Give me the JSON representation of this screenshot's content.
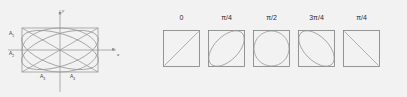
{
  "figure": {
    "background_color": "#f2f2f2",
    "stroke_color": "#8a8a8a",
    "text_color": "#3a3a3a"
  },
  "left_panel": {
    "name": "amplitude-rectangle-diagram",
    "axis_x_label": "x",
    "axis_y_label": "y",
    "labels": [
      {
        "text": "A",
        "sub": "1",
        "x": 9,
        "y": 33
      },
      {
        "text": "A",
        "sub": "2",
        "x": 9,
        "y": 53
      },
      {
        "text": "A",
        "sub": "3",
        "x": 40,
        "y": 75
      },
      {
        "text": "A",
        "sub": "4",
        "x": 70,
        "y": 75
      }
    ],
    "rect": {
      "x": 22,
      "y": 28,
      "width": 76,
      "height": 44
    },
    "origin": {
      "x": 60,
      "y": 50
    },
    "ellipses": [
      {
        "rx": 38,
        "ry": 22,
        "rotate": 0
      },
      {
        "rx": 40,
        "ry": 16,
        "rotate": 18
      },
      {
        "rx": 40,
        "ry": 16,
        "rotate": -18
      }
    ],
    "diagonals": true
  },
  "right_panel": {
    "name": "polarization-state-row",
    "box_size": 37,
    "box_top": 30,
    "label_top": 14,
    "boxes": [
      {
        "phase_label": "0",
        "shape": "line-diagonal-up",
        "left": 163
      },
      {
        "phase_label": "π/4",
        "shape": "ellipse-tilt-right",
        "left": 208
      },
      {
        "phase_label": "π/2",
        "shape": "circle",
        "left": 253
      },
      {
        "phase_label": "3π/4",
        "shape": "ellipse-tilt-left",
        "left": 298
      },
      {
        "phase_label": "π/4",
        "shape": "line-diagonal-down",
        "left": 343
      }
    ]
  }
}
